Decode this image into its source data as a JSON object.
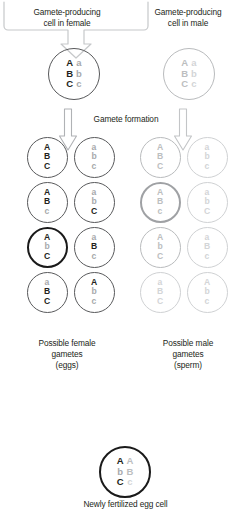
{
  "figure": {
    "colors": {
      "dominant_text": "#231f20",
      "recessive_text": "#a7a9ac",
      "faded_cell": "#b9bbbd",
      "selected_ring": "#1a1a1a",
      "highlight_ring": "#9fa1a4",
      "background": "#ffffff"
    }
  },
  "headers": {
    "female_parent": "Gamete-producing\ncell in female",
    "female_parent_line1": "Gamete-producing",
    "female_parent_line2": "cell in female",
    "male_parent_line1": "Gamete-producing",
    "male_parent_line2": "cell in male"
  },
  "process": {
    "gamete_formation_label": "Gamete formation"
  },
  "parent_cells": {
    "female": {
      "name": "gamete-producing cell in female",
      "emphasis": "normal",
      "ring": "thin",
      "left_column": [
        "A",
        "B",
        "C"
      ],
      "right_column": [
        "a",
        "b",
        "c"
      ],
      "left_style": [
        "dark",
        "dark",
        "dark"
      ],
      "right_style": [
        "gray",
        "gray",
        "gray"
      ]
    },
    "male": {
      "name": "gamete-producing cell in male",
      "emphasis": "faded",
      "ring": "faint",
      "left_column": [
        "A",
        "B",
        "C"
      ],
      "right_column": [
        "a",
        "b",
        "c"
      ],
      "left_style": [
        "gray2",
        "gray2",
        "gray2"
      ],
      "right_style": [
        "gray3",
        "gray3",
        "gray3"
      ]
    }
  },
  "gametes": {
    "female_caption_line1": "Possible female",
    "female_caption_line2": "gametes",
    "female_caption_line3": "(eggs)",
    "male_caption_line1": "Possible male",
    "male_caption_line2": "gametes",
    "male_caption_line3": "(sperm)",
    "female_list": [
      {
        "alleles": [
          "A",
          "B",
          "C"
        ],
        "styles": [
          "dark",
          "dark",
          "dark"
        ],
        "ring": "thin",
        "selected": false
      },
      {
        "alleles": [
          "a",
          "b",
          "c"
        ],
        "styles": [
          "gray",
          "gray",
          "gray"
        ],
        "ring": "thin",
        "selected": false
      },
      {
        "alleles": [
          "A",
          "B",
          "c"
        ],
        "styles": [
          "dark",
          "dark",
          "gray"
        ],
        "ring": "thin",
        "selected": false
      },
      {
        "alleles": [
          "a",
          "b",
          "C"
        ],
        "styles": [
          "gray",
          "gray",
          "dark"
        ],
        "ring": "thin",
        "selected": false
      },
      {
        "alleles": [
          "A",
          "b",
          "C"
        ],
        "styles": [
          "dark",
          "gray",
          "dark"
        ],
        "ring": "bold",
        "selected": true
      },
      {
        "alleles": [
          "a",
          "B",
          "c"
        ],
        "styles": [
          "gray",
          "dark",
          "gray"
        ],
        "ring": "thin",
        "selected": false
      },
      {
        "alleles": [
          "a",
          "B",
          "C"
        ],
        "styles": [
          "gray",
          "dark",
          "dark"
        ],
        "ring": "thin",
        "selected": false
      },
      {
        "alleles": [
          "A",
          "b",
          "c"
        ],
        "styles": [
          "dark",
          "gray",
          "gray"
        ],
        "ring": "thin",
        "selected": false
      }
    ],
    "male_list": [
      {
        "alleles": [
          "A",
          "B",
          "C"
        ],
        "styles": [
          "gray2",
          "gray2",
          "gray2"
        ],
        "ring": "faint",
        "selected": false
      },
      {
        "alleles": [
          "a",
          "b",
          "c"
        ],
        "styles": [
          "gray3",
          "gray3",
          "gray3"
        ],
        "ring": "veryfaint",
        "selected": false
      },
      {
        "alleles": [
          "A",
          "B",
          "c"
        ],
        "styles": [
          "gray2",
          "gray2",
          "gray2"
        ],
        "ring": "grayhl",
        "selected": true
      },
      {
        "alleles": [
          "a",
          "b",
          "C"
        ],
        "styles": [
          "gray3",
          "gray3",
          "gray3"
        ],
        "ring": "veryfaint",
        "selected": false
      },
      {
        "alleles": [
          "A",
          "b",
          "C"
        ],
        "styles": [
          "gray2",
          "gray2",
          "gray2"
        ],
        "ring": "faint",
        "selected": false
      },
      {
        "alleles": [
          "a",
          "B",
          "c"
        ],
        "styles": [
          "gray3",
          "gray3",
          "gray3"
        ],
        "ring": "veryfaint",
        "selected": false
      },
      {
        "alleles": [
          "a",
          "B",
          "C"
        ],
        "styles": [
          "gray3",
          "gray3",
          "gray3"
        ],
        "ring": "veryfaint",
        "selected": false
      },
      {
        "alleles": [
          "A",
          "b",
          "c"
        ],
        "styles": [
          "gray3",
          "gray3",
          "gray3"
        ],
        "ring": "veryfaint",
        "selected": false
      }
    ]
  },
  "zygote": {
    "caption": "Newly fertilized egg cell",
    "ring": "bold",
    "left_column": [
      "A",
      "b",
      "C"
    ],
    "right_column": [
      "A",
      "B",
      "c"
    ],
    "left_style": [
      "dark",
      "gray",
      "dark"
    ],
    "right_style": [
      "gray2",
      "gray2",
      "gray3"
    ]
  }
}
